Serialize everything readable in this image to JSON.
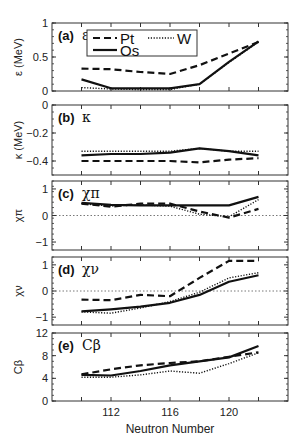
{
  "chart_data": {
    "type": "line",
    "xlabel": "Neutron Number",
    "x": [
      110,
      112,
      114,
      116,
      118,
      120,
      122
    ],
    "xlim": [
      108,
      124
    ],
    "xticks": [
      112,
      116,
      120
    ],
    "legend": {
      "position": "top-left inside panel (a)",
      "entries": [
        {
          "name": "Pt",
          "style": "dashed"
        },
        {
          "name": "W",
          "style": "dotted"
        },
        {
          "name": "Os",
          "style": "solid"
        }
      ]
    },
    "panels": [
      {
        "id": "a",
        "label": "(a)",
        "symbol": "ε",
        "ylabel": "ε (MeV)",
        "ylim": [
          0,
          1
        ],
        "yticks": [
          "0",
          "0.5",
          "1"
        ],
        "zero_line": false,
        "series": [
          {
            "name": "Pt",
            "values": [
              0.33,
              0.32,
              0.28,
              0.25,
              0.38,
              0.55,
              0.72
            ]
          },
          {
            "name": "W",
            "values": [
              0.05,
              0.03,
              0.02,
              0.02,
              0.1,
              0.42,
              0.72
            ]
          },
          {
            "name": "Os",
            "values": [
              0.17,
              0.04,
              0.04,
              0.04,
              0.1,
              0.43,
              0.73
            ]
          }
        ]
      },
      {
        "id": "b",
        "label": "(b)",
        "symbol": "κ",
        "ylabel": "κ (MeV)",
        "ylim": [
          -0.5,
          0
        ],
        "yticks": [
          "0",
          "−0.2",
          "−0.4"
        ],
        "zero_line": false,
        "series": [
          {
            "name": "Pt",
            "values": [
              -0.4,
              -0.4,
              -0.4,
              -0.4,
              -0.41,
              -0.39,
              -0.38
            ]
          },
          {
            "name": "W",
            "values": [
              -0.33,
              -0.33,
              -0.33,
              -0.33,
              -0.31,
              -0.33,
              -0.33
            ]
          },
          {
            "name": "Os",
            "values": [
              -0.36,
              -0.35,
              -0.35,
              -0.34,
              -0.31,
              -0.33,
              -0.36
            ]
          }
        ]
      },
      {
        "id": "c",
        "label": "(c)",
        "symbol": "χπ",
        "ylabel": "χπ",
        "ylim": [
          -1.3,
          1.3
        ],
        "yticks": [
          "−1",
          "0",
          "1"
        ],
        "zero_line": true,
        "series": [
          {
            "name": "Pt",
            "values": [
              0.45,
              0.33,
              0.45,
              0.45,
              0.15,
              -0.08,
              0.25
            ]
          },
          {
            "name": "W",
            "values": [
              0.45,
              0.35,
              0.4,
              0.35,
              0.05,
              -0.05,
              0.6
            ]
          },
          {
            "name": "Os",
            "values": [
              0.48,
              0.4,
              0.38,
              0.38,
              0.38,
              0.38,
              0.7
            ]
          }
        ]
      },
      {
        "id": "d",
        "label": "(d)",
        "symbol": "χν",
        "ylabel": "χν",
        "ylim": [
          -1.3,
          1.3
        ],
        "yticks": [
          "−1",
          "0",
          "1"
        ],
        "zero_line": true,
        "series": [
          {
            "name": "Pt",
            "values": [
              -0.33,
              -0.35,
              -0.15,
              -0.2,
              0.5,
              1.15,
              1.15
            ]
          },
          {
            "name": "W",
            "values": [
              -0.8,
              -0.85,
              -0.65,
              -0.4,
              -0.05,
              0.5,
              0.7
            ]
          },
          {
            "name": "Os",
            "values": [
              -0.78,
              -0.7,
              -0.6,
              -0.45,
              -0.15,
              0.35,
              0.6
            ]
          }
        ]
      },
      {
        "id": "e",
        "label": "(e)",
        "symbol": "Cβ",
        "ylabel": "Cβ",
        "ylim": [
          0,
          12
        ],
        "yticks": [
          "0",
          "4",
          "8",
          "12"
        ],
        "zero_line": false,
        "series": [
          {
            "name": "Pt",
            "values": [
              4.7,
              5.6,
              6.3,
              6.7,
              7.0,
              7.8,
              8.6
            ]
          },
          {
            "name": "W",
            "values": [
              4.2,
              4.2,
              4.6,
              5.3,
              4.9,
              6.6,
              8.5
            ]
          },
          {
            "name": "Os",
            "values": [
              4.6,
              4.5,
              5.3,
              6.3,
              7.0,
              7.7,
              9.7
            ]
          }
        ]
      }
    ]
  }
}
